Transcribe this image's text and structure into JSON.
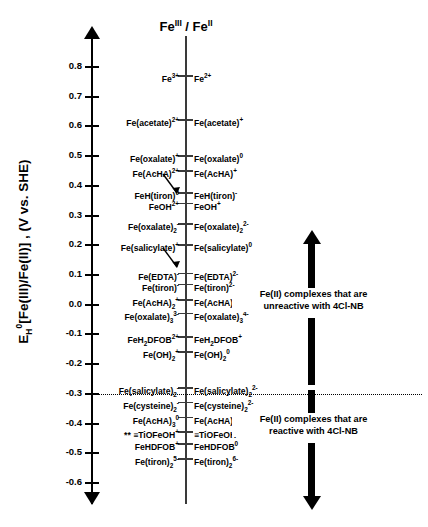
{
  "figure": {
    "header": "Fe",
    "header_sup_1": "III",
    "header_mid": " / Fe",
    "header_sup_2": "II",
    "axis_title_main": "E",
    "axis_title_sub": "H",
    "axis_title_sup": "0",
    "axis_title_rest": "[Fe(III)/Fe(II)] , (V vs. SHE)",
    "threshold_value": -0.3,
    "annotation_up": "Fe(II) complexes that are unreactive with 4Cl-NB",
    "annotation_up_line1": "Fe(II) complexes that are",
    "annotation_up_line2": "unreactive with 4Cl-NB",
    "annotation_down_line1": "Fe(II) complexes that are",
    "annotation_down_line2": "reactive with 4Cl-NB"
  },
  "chart_data": {
    "type": "scatter",
    "xlabel": "",
    "ylabel": "E_H^0[Fe(III)/Fe(II)] , (V vs. SHE)",
    "ylim": [
      -0.65,
      0.88
    ],
    "yticks": [
      0.8,
      0.7,
      0.6,
      0.5,
      0.4,
      0.3,
      0.2,
      0.1,
      0.0,
      -0.1,
      -0.2,
      -0.3,
      -0.4,
      -0.5,
      -0.6
    ],
    "ytick_labels": [
      "0.8",
      "0.7",
      "0.6",
      "0.5",
      "0.4",
      "0.3",
      "0.2",
      "0.1",
      "0.0",
      "-0.1",
      "-0.2",
      "-0.3",
      "-0.4",
      "-0.5",
      "-0.6"
    ],
    "grid": false,
    "legend": "none",
    "threshold_line": {
      "value": -0.3,
      "style": "dotted",
      "label": "reactivity boundary with 4Cl-NB"
    },
    "couples": [
      {
        "potential": 0.77,
        "oxidized": "Fe3+",
        "reduced": "Fe2+",
        "ox_html": "Fe<sup>3+</sup>",
        "red_html": "Fe<sup>2+</sup>"
      },
      {
        "potential": 0.62,
        "oxidized": "Fe(acetate)2+",
        "reduced": "Fe(acetate)+",
        "ox_html": "Fe(acetate)<sup>2+</sup>",
        "red_html": "Fe(acetate)<sup>+</sup>"
      },
      {
        "potential": 0.5,
        "oxidized": "Fe(oxalate)+",
        "reduced": "Fe(oxalate)0",
        "ox_html": "Fe(oxalate)<sup>+</sup>",
        "red_html": "Fe(oxalate)<sup>0</sup>"
      },
      {
        "potential": 0.45,
        "oxidized": "Fe(AcHA)2+",
        "reduced": "Fe(AcHA)+",
        "ox_html": "Fe(AcHA)<sup>2+</sup>",
        "red_html": "Fe(AcHA)<sup>+</sup>",
        "leader": true
      },
      {
        "potential": 0.375,
        "oxidized": "FeH(tiron)0",
        "reduced": "FeH(tiron)-",
        "ox_html": "FeH(tiron)<sup>0</sup>",
        "red_html": "FeH(tiron)<sup>-</sup>"
      },
      {
        "potential": 0.34,
        "oxidized": "FeOH2+",
        "reduced": "FeOH+",
        "ox_html": "FeOH<sup>2+</sup>",
        "red_html": "FeOH<sup>+</sup>"
      },
      {
        "potential": 0.27,
        "oxidized": "Fe(oxalate)2-",
        "reduced": "Fe(oxalate)2 2-",
        "ox_html": "Fe(oxalate)<sub>2</sub><sup>-</sup>",
        "red_html": "Fe(oxalate)<sub>2</sub><sup>2-</sup>"
      },
      {
        "potential": 0.2,
        "oxidized": "Fe(salicylate)+",
        "reduced": "Fe(salicylate)0",
        "ox_html": "Fe(salicylate)<sup>+</sup>",
        "red_html": "Fe(salicylate)<sup>0</sup>",
        "leader": true
      },
      {
        "potential": 0.105,
        "oxidized": "Fe(EDTA)-",
        "reduced": "Fe(EDTA)2-",
        "ox_html": "Fe(EDTA)<sup>-</sup>",
        "red_html": "Fe(EDTA)<sup>2-</sup>"
      },
      {
        "potential": 0.068,
        "oxidized": "Fe(tiron)-",
        "reduced": "Fe(tiron)2-",
        "ox_html": "Fe(tiron)<sup>-</sup>",
        "red_html": "Fe(tiron)<sup>2-</sup>"
      },
      {
        "potential": 0.015,
        "oxidized": "Fe(AcHA)2+",
        "reduced": "Fe(AcHA)2 0",
        "ox_html": "Fe(AcHA)<sub>2</sub><sup>+</sup>",
        "red_html": "Fe(AcHA)<sub>2</sub><sup>0</sup>"
      },
      {
        "potential": -0.03,
        "oxidized": "Fe(oxalate)3 3-",
        "reduced": "Fe(oxalate)3 4-",
        "ox_html": "Fe(oxalate)<sub>3</sub><sup>3-</sup>",
        "red_html": "Fe(oxalate)<sub>3</sub><sup>4-</sup>"
      },
      {
        "potential": -0.11,
        "oxidized": "FeH2DFOB2+",
        "reduced": "FeH2DFOB+",
        "ox_html": "FeH<sub>2</sub>DFOB<sup>2+</sup>",
        "red_html": "FeH<sub>2</sub>DFOB<sup>+</sup>"
      },
      {
        "potential": -0.16,
        "oxidized": "Fe(OH)2+",
        "reduced": "Fe(OH)2 0",
        "ox_html": "Fe(OH)<sub>2</sub><sup>+</sup>",
        "red_html": "Fe(OH)<sub>2</sub><sup>0</sup>"
      },
      {
        "potential": -0.28,
        "oxidized": "Fe(salicylate)2-",
        "reduced": "Fe(salicylate)2 2-",
        "ox_html": "Fe(salicylate)<sub>2</sub><sup>-</sup>",
        "red_html": "Fe(salicylate)<sub>2</sub><sup>2-</sup>"
      },
      {
        "potential": -0.33,
        "oxidized": "Fe(cysteine)2-",
        "reduced": "Fe(cysteine)2 2-",
        "ox_html": "Fe(cysteine)<sub>2</sub><sup>-</sup>",
        "red_html": "Fe(cysteine)<sub>2</sub><sup>2-</sup>"
      },
      {
        "potential": -0.38,
        "oxidized": "Fe(AcHA)3 0",
        "reduced": "Fe(AcHA)3 -",
        "ox_html": "Fe(AcHA)<sub>3</sub><sup>0</sup>",
        "red_html": "Fe(AcHA)<sub>3</sub><sup>-</sup>"
      },
      {
        "potential": -0.43,
        "oxidized": "** =TiOFeOH+",
        "reduced": "=TiOFeOH0",
        "ox_html": "** &#8801;TiOFeOH<sup>+</sup>",
        "red_html": "&#8801;TiOFeOH<sup>0</sup>"
      },
      {
        "potential": -0.47,
        "oxidized": "FeHDFOB+",
        "reduced": "FeHDFOB0",
        "ox_html": "FeHDFOB<sup>+</sup>",
        "red_html": "FeHDFOB<sup>0</sup>"
      },
      {
        "potential": -0.52,
        "oxidized": "Fe(tiron)2 5-",
        "reduced": "Fe(tiron)2 6-",
        "ox_html": "Fe(tiron)<sub>2</sub><sup>5-</sup>",
        "red_html": "Fe(tiron)<sub>2</sub><sup>6-</sup>"
      }
    ],
    "annotations": [
      {
        "text": "Fe(II) complexes that are unreactive with 4Cl-NB",
        "region": "above -0.3 V",
        "arrow": "up"
      },
      {
        "text": "Fe(II) complexes that are reactive with 4Cl-NB",
        "region": "below -0.3 V",
        "arrow": "down"
      }
    ]
  }
}
